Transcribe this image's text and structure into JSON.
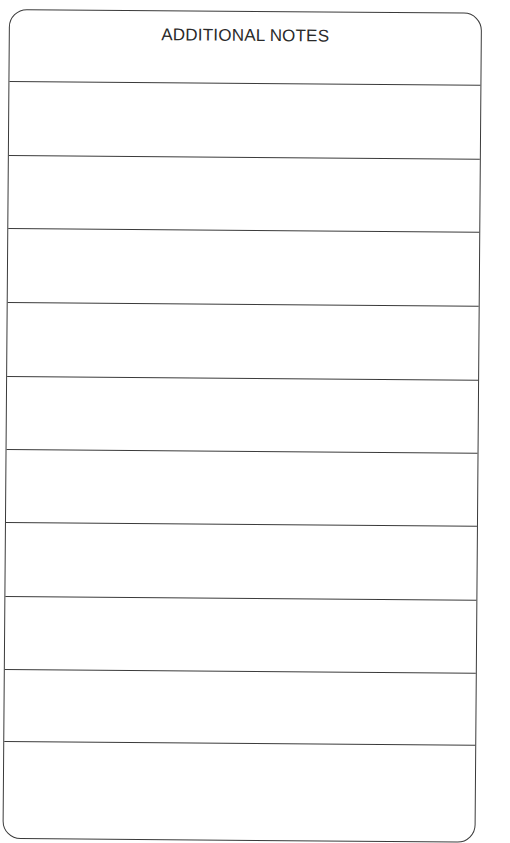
{
  "card": {
    "title": "ADDITIONAL NOTES",
    "line_count": 10,
    "line_positions_px": [
      71,
      145,
      218,
      292,
      366,
      439,
      512,
      586,
      659,
      731
    ]
  }
}
